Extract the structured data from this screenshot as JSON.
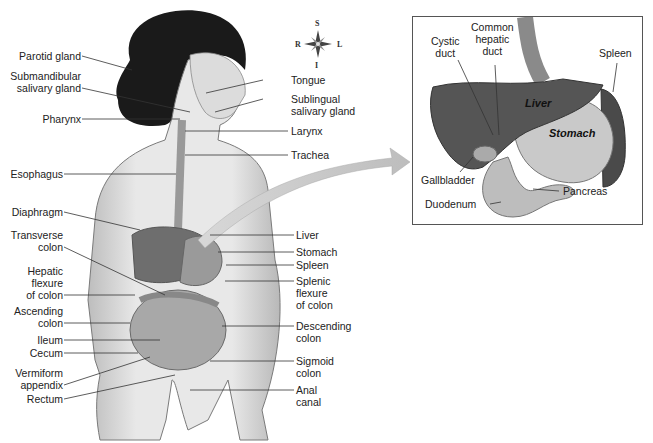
{
  "figure": {
    "compass": {
      "superior": "S",
      "inferior": "I",
      "right": "R",
      "left": "L"
    },
    "left_labels": [
      {
        "text": "Parotid gland"
      },
      {
        "text": "Submandibular\nsalivary gland"
      },
      {
        "text": "Pharynx"
      },
      {
        "text": "Esophagus"
      },
      {
        "text": "Diaphragm"
      },
      {
        "text": "Transverse\ncolon"
      },
      {
        "text": "Hepatic\nflexure\nof colon"
      },
      {
        "text": "Ascending\ncolon"
      },
      {
        "text": "Ileum"
      },
      {
        "text": "Cecum"
      },
      {
        "text": "Vermiform\nappendix"
      },
      {
        "text": "Rectum"
      }
    ],
    "right_labels": [
      {
        "text": "Tongue"
      },
      {
        "text": "Sublingual\nsalivary gland"
      },
      {
        "text": "Larynx"
      },
      {
        "text": "Trachea"
      },
      {
        "text": "Liver"
      },
      {
        "text": "Stomach"
      },
      {
        "text": "Spleen"
      },
      {
        "text": "Splenic\nflexure\nof colon"
      },
      {
        "text": "Descending\ncolon"
      },
      {
        "text": "Sigmoid\ncolon"
      },
      {
        "text": "Anal\ncanal"
      }
    ],
    "inset": {
      "labels": {
        "cystic_duct": "Cystic\nduct",
        "common_hepatic_duct": "Common\nhepatic\nduct",
        "spleen": "Spleen",
        "gallbladder": "Gallbladder",
        "pancreas": "Pancreas",
        "duodenum": "Duodenum"
      },
      "organ_text": {
        "liver": "Liver",
        "stomach": "Stomach"
      }
    }
  }
}
